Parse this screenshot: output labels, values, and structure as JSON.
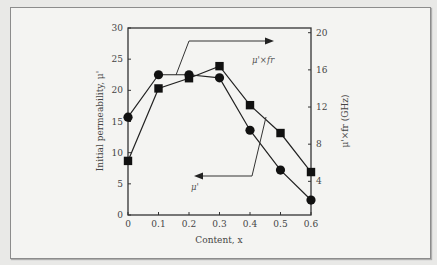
{
  "chart_data": {
    "type": "line",
    "title": "",
    "xlabel": "Content, x",
    "ylabel": "Initial permeability, μ'",
    "y2label": "μ'×fr (GHz)",
    "x": [
      0,
      0.1,
      0.2,
      0.3,
      0.4,
      0.5,
      0.6
    ],
    "x_ticks": [
      "0",
      "0.1",
      "0.2",
      "0.3",
      "0.4",
      "0.5",
      "0.6"
    ],
    "y_ticks": [
      "0",
      "5",
      "10",
      "15",
      "20",
      "25",
      "30"
    ],
    "y2_ticks": [
      "4",
      "8",
      "12",
      "16",
      "20"
    ],
    "ylim": [
      0,
      30
    ],
    "y2lim": [
      0,
      20
    ],
    "xlim": [
      0,
      0.6
    ],
    "grid": false,
    "series": [
      {
        "name": "μ'",
        "axis": "left",
        "marker": "circle",
        "values": [
          15.7,
          22.5,
          22.5,
          22.0,
          13.6,
          7.2,
          2.4
        ]
      },
      {
        "name": "μ'×fr",
        "axis": "right",
        "marker": "square",
        "values": [
          6.2,
          14.0,
          15.1,
          16.4,
          12.2,
          9.2,
          5.0
        ]
      }
    ],
    "annotations": [
      {
        "text": "μ'×fr",
        "arrow": "right",
        "points_to": "right axis"
      },
      {
        "text": "μ'",
        "arrow": "left",
        "points_to": "left axis"
      }
    ]
  },
  "labels": {
    "xlabel": "Content, x",
    "ylabel": "Initial permeability, μ'",
    "y2label": "μ'×fr (GHz)",
    "anno_right": "μ'×fr",
    "anno_left": "μ'"
  }
}
